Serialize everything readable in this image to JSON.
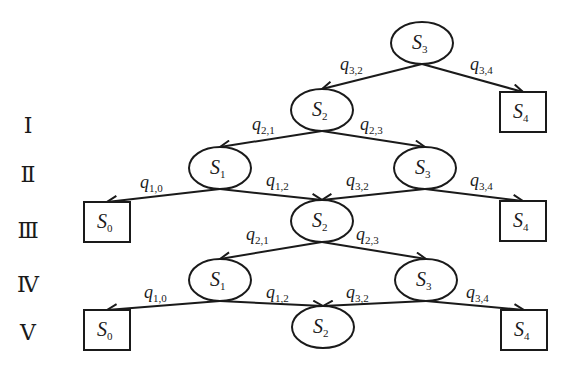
{
  "diagram": {
    "type": "state-transition-tree",
    "levels": [
      "Ⅰ",
      "Ⅱ",
      "Ⅲ",
      "Ⅳ",
      "Ⅴ"
    ],
    "nodes": [
      {
        "id": "n0",
        "label": "S",
        "sub": "3",
        "shape": "ellipse",
        "cx": 422,
        "cy": 43
      },
      {
        "id": "n1",
        "label": "S",
        "sub": "2",
        "shape": "ellipse",
        "cx": 322,
        "cy": 110
      },
      {
        "id": "n2",
        "label": "S",
        "sub": "4",
        "shape": "box",
        "cx": 523,
        "cy": 112
      },
      {
        "id": "n3",
        "label": "S",
        "sub": "1",
        "shape": "ellipse",
        "cx": 220,
        "cy": 168
      },
      {
        "id": "n4",
        "label": "S",
        "sub": "3",
        "shape": "ellipse",
        "cx": 425,
        "cy": 168
      },
      {
        "id": "n5",
        "label": "S",
        "sub": "0",
        "shape": "box",
        "cx": 107,
        "cy": 222
      },
      {
        "id": "n6",
        "label": "S",
        "sub": "2",
        "shape": "ellipse",
        "cx": 322,
        "cy": 221
      },
      {
        "id": "n7",
        "label": "S",
        "sub": "4",
        "shape": "box",
        "cx": 523,
        "cy": 221
      },
      {
        "id": "n8",
        "label": "S",
        "sub": "1",
        "shape": "ellipse",
        "cx": 220,
        "cy": 280
      },
      {
        "id": "n9",
        "label": "S",
        "sub": "3",
        "shape": "ellipse",
        "cx": 426,
        "cy": 280
      },
      {
        "id": "n10",
        "label": "S",
        "sub": "0",
        "shape": "box",
        "cx": 107,
        "cy": 330
      },
      {
        "id": "n11",
        "label": "S",
        "sub": "2",
        "shape": "ellipse",
        "cx": 323,
        "cy": 327
      },
      {
        "id": "n12",
        "label": "S",
        "sub": "4",
        "shape": "box",
        "cx": 524,
        "cy": 330
      }
    ],
    "edges": [
      {
        "from": "n0",
        "to": "n1",
        "label": "q",
        "sub": "3,2",
        "lx": 340,
        "ly": 70
      },
      {
        "from": "n0",
        "to": "n2",
        "label": "q",
        "sub": "3,4",
        "lx": 470,
        "ly": 70
      },
      {
        "from": "n1",
        "to": "n3",
        "label": "q",
        "sub": "2,1",
        "lx": 252,
        "ly": 130
      },
      {
        "from": "n1",
        "to": "n4",
        "label": "q",
        "sub": "2,3",
        "lx": 360,
        "ly": 130
      },
      {
        "from": "n3",
        "to": "n5",
        "label": "q",
        "sub": "1,0",
        "lx": 140,
        "ly": 188
      },
      {
        "from": "n3",
        "to": "n6",
        "label": "q",
        "sub": "1,2",
        "lx": 266,
        "ly": 186
      },
      {
        "from": "n4",
        "to": "n6",
        "label": "q",
        "sub": "3,2",
        "lx": 346,
        "ly": 186
      },
      {
        "from": "n4",
        "to": "n7",
        "label": "q",
        "sub": "3,4",
        "lx": 470,
        "ly": 186
      },
      {
        "from": "n6",
        "to": "n8",
        "label": "q",
        "sub": "2,1",
        "lx": 246,
        "ly": 240
      },
      {
        "from": "n6",
        "to": "n9",
        "label": "q",
        "sub": "2,3",
        "lx": 356,
        "ly": 240
      },
      {
        "from": "n8",
        "to": "n10",
        "label": "q",
        "sub": "1,0",
        "lx": 144,
        "ly": 298
      },
      {
        "from": "n8",
        "to": "n11",
        "label": "q",
        "sub": "1,2",
        "lx": 266,
        "ly": 298
      },
      {
        "from": "n9",
        "to": "n11",
        "label": "q",
        "sub": "3,2",
        "lx": 346,
        "ly": 298
      },
      {
        "from": "n9",
        "to": "n12",
        "label": "q",
        "sub": "3,4",
        "lx": 466,
        "ly": 298
      }
    ],
    "level_positions": [
      {
        "label": "Ⅰ",
        "x": 28,
        "y": 133
      },
      {
        "label": "Ⅱ",
        "x": 28,
        "y": 182
      },
      {
        "label": "Ⅲ",
        "x": 28,
        "y": 238
      },
      {
        "label": "Ⅳ",
        "x": 28,
        "y": 292
      },
      {
        "label": "Ⅴ",
        "x": 28,
        "y": 340
      }
    ],
    "colors": {
      "stroke": "#1a1a1a",
      "background": "#ffffff"
    }
  }
}
